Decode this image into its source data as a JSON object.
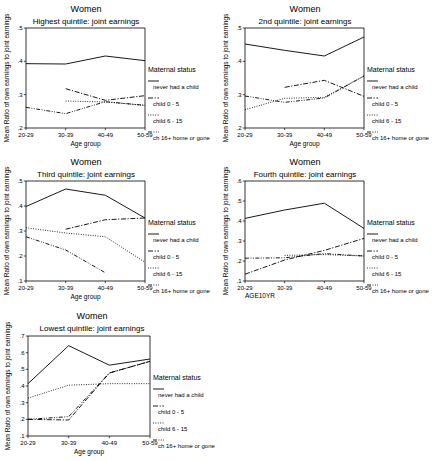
{
  "figure": {
    "panel_count": 5,
    "series_names": [
      "never had a child",
      "child 0 - 5",
      "child 6 - 15",
      "ch 16+ home or gone"
    ],
    "legend_title": "Maternal status",
    "main_title": "Women",
    "ylabel": "Mean Ratio of own earnings to joint earnings",
    "xlabel": "Age group",
    "xlabel_alt": "AGE10YR",
    "categories": [
      "20-29",
      "30-39",
      "40-49",
      "50-59"
    ]
  },
  "chart_data": [
    {
      "type": "line",
      "title": "Women",
      "subtitle": "Highest quintile: joint earnings",
      "xlabel": "Age group",
      "ylabel": "Mean Ratio of own earnings to joint earnings",
      "categories": [
        "20-29",
        "30-39",
        "40-49",
        "50-59"
      ],
      "ylim": [
        0.2,
        0.5
      ],
      "yticks": [
        ".2",
        ".3",
        ".4",
        ".5"
      ],
      "grid": false,
      "legend_title": "Maternal status",
      "legend_position": "right",
      "series": [
        {
          "name": "never had a child",
          "style": "solid",
          "values": [
            0.393,
            0.392,
            0.416,
            0.402
          ]
        },
        {
          "name": "child 0 - 5",
          "style": "dashdot",
          "values": [
            null,
            0.318,
            0.283,
            0.297
          ]
        },
        {
          "name": "child 6 - 15",
          "style": "dotted",
          "values": [
            null,
            0.281,
            0.278,
            0.268
          ]
        },
        {
          "name": "ch 16+ home or gone",
          "style": "dashdotdot",
          "values": [
            0.262,
            0.243,
            0.279,
            0.268
          ]
        }
      ]
    },
    {
      "type": "line",
      "title": "Women",
      "subtitle": "2nd quintile: joint earnings",
      "xlabel": "Age group",
      "ylabel": "Mean Ratio of own earnings to joint earnings",
      "categories": [
        "20-29",
        "30-39",
        "40-49",
        "50-59"
      ],
      "ylim": [
        0.2,
        0.5
      ],
      "yticks": [
        ".2",
        ".3",
        ".4",
        ".5"
      ],
      "grid": false,
      "legend_title": "Maternal status",
      "legend_position": "right",
      "series": [
        {
          "name": "never had a child",
          "style": "solid",
          "values": [
            0.452,
            0.433,
            0.416,
            0.473
          ]
        },
        {
          "name": "child 0 - 5",
          "style": "dashdot",
          "values": [
            null,
            0.322,
            0.343,
            0.295
          ]
        },
        {
          "name": "child 6 - 15",
          "style": "dotted",
          "values": [
            0.255,
            0.289,
            0.292,
            0.356
          ]
        },
        {
          "name": "ch 16+ home or gone",
          "style": "dashdotdot",
          "values": [
            0.296,
            0.277,
            0.29,
            0.356
          ]
        }
      ]
    },
    {
      "type": "line",
      "title": "Women",
      "subtitle": "Third quintile: joint earnings",
      "xlabel": "Age group",
      "ylabel": "Mean Ratio of own earnings to joint earnings",
      "categories": [
        "20-29",
        "30-39",
        "40-49",
        "50-59"
      ],
      "ylim": [
        0.1,
        0.5
      ],
      "yticks": [
        ".1",
        ".2",
        ".3",
        ".4",
        ".5"
      ],
      "grid": false,
      "legend_title": "Maternal status",
      "legend_position": "right",
      "series": [
        {
          "name": "never had a child",
          "style": "solid",
          "values": [
            0.398,
            0.468,
            0.443,
            0.352
          ]
        },
        {
          "name": "child 0 - 5",
          "style": "dashdot",
          "values": [
            null,
            0.307,
            0.345,
            0.352
          ]
        },
        {
          "name": "child 6 - 15",
          "style": "dotted",
          "values": [
            0.313,
            0.292,
            0.277,
            0.175
          ]
        },
        {
          "name": "ch 16+ home or gone",
          "style": "dashdotdot",
          "values": [
            0.277,
            0.224,
            0.133,
            null
          ]
        }
      ]
    },
    {
      "type": "line",
      "title": "Women",
      "subtitle": "Fourth quintile: joint earnings",
      "xlabel": "AGE10YR",
      "ylabel": "Mean Ratio of own earnings to joint earnings",
      "categories": [
        "20-29",
        "30-39",
        "40-49",
        "50-59"
      ],
      "ylim": [
        0.1,
        0.6
      ],
      "yticks": [
        ".1",
        ".2",
        ".3",
        ".4",
        ".5",
        ".6"
      ],
      "grid": false,
      "legend_title": "Maternal status",
      "legend_position": "right",
      "series": [
        {
          "name": "never had a child",
          "style": "solid",
          "values": [
            0.413,
            0.455,
            0.489,
            0.363
          ]
        },
        {
          "name": "child 0 - 5",
          "style": "dashdot",
          "values": [
            0.134,
            0.205,
            0.253,
            0.313
          ]
        },
        {
          "name": "child 6 - 15",
          "style": "dotted",
          "values": [
            null,
            0.228,
            0.232,
            0.225
          ]
        },
        {
          "name": "ch 16+ home or gone",
          "style": "dashdotdot",
          "values": [
            0.214,
            0.216,
            0.237,
            0.225
          ]
        }
      ]
    },
    {
      "type": "line",
      "title": "Women",
      "subtitle": "Lowest quintile: joint earnings",
      "xlabel": "Age group",
      "ylabel": "Mean Ratio of own earnings to joint earnings",
      "categories": [
        "20-29",
        "30-39",
        "40-49",
        "50-59"
      ],
      "ylim": [
        0.1,
        0.7
      ],
      "yticks": [
        ".1",
        ".2",
        ".3",
        ".4",
        ".5",
        ".6",
        ".7"
      ],
      "grid": false,
      "legend_title": "Maternal status",
      "legend_position": "right",
      "series": [
        {
          "name": "never had a child",
          "style": "solid",
          "values": [
            0.414,
            0.642,
            0.525,
            0.562
          ]
        },
        {
          "name": "child 0 - 5",
          "style": "dashdot",
          "values": [
            0.2,
            0.196,
            0.478,
            0.548
          ]
        },
        {
          "name": "child 6 - 15",
          "style": "dotted",
          "values": [
            0.327,
            0.405,
            0.414,
            0.414
          ]
        },
        {
          "name": "ch 16+ home or gone",
          "style": "dashdotdot",
          "values": [
            0.2,
            0.216,
            0.478,
            0.548
          ]
        }
      ]
    }
  ]
}
